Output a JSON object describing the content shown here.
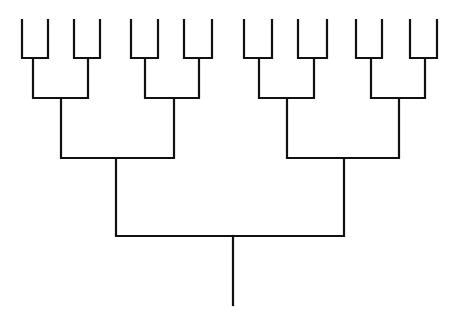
{
  "diagram": {
    "type": "binary-tree",
    "orientation": "root-bottom",
    "depth": 4,
    "leaf_count": 16,
    "stroke_color": "#111111",
    "background": "#ffffff",
    "root": {
      "x": 233,
      "top": 236,
      "bottom": 305
    },
    "levels": {
      "leaves": [
        {
          "x": 22
        },
        {
          "x": 48
        },
        {
          "x": 74
        },
        {
          "x": 100
        },
        {
          "x": 131
        },
        {
          "x": 158
        },
        {
          "x": 184
        },
        {
          "x": 212
        },
        {
          "x": 244
        },
        {
          "x": 272
        },
        {
          "x": 298
        },
        {
          "x": 327
        },
        {
          "x": 356
        },
        {
          "x": 382
        },
        {
          "x": 410
        },
        {
          "x": 437
        }
      ],
      "leaf_top_y": 20,
      "level1_bar_y": 58,
      "level1_stems": [
        33,
        88,
        145,
        199,
        259,
        314,
        371,
        425
      ],
      "level2_bar_y": 98,
      "level2_stems": [
        61,
        174,
        287,
        399
      ],
      "level3_bar_y": 158,
      "level3_stems": [
        116,
        344
      ],
      "level4_bar_y": 236
    }
  }
}
